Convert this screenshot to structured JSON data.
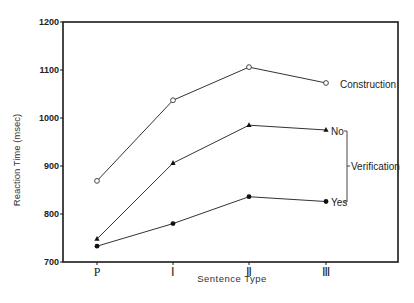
{
  "chart_data": {
    "type": "line",
    "title": "",
    "xlabel": "Sentence Type",
    "ylabel": "Reaction Time (msec)",
    "categories": [
      "P",
      "I",
      "II",
      "III"
    ],
    "category_glyphs": [
      "P",
      "Ⅰ",
      "Ⅱ",
      "Ⅲ"
    ],
    "ylim": [
      700,
      1200
    ],
    "yticks": [
      700,
      800,
      900,
      1000,
      1100,
      1200
    ],
    "grid": false,
    "series": [
      {
        "name": "Construction",
        "marker": "open-circle",
        "values": [
          869,
          1037,
          1106,
          1073
        ]
      },
      {
        "name": "No",
        "marker": "filled-triangle",
        "values": [
          748,
          906,
          985,
          975
        ]
      },
      {
        "name": "Yes",
        "marker": "filled-circle",
        "values": [
          733,
          780,
          836,
          826
        ]
      }
    ],
    "annotations": [
      {
        "text": "Construction",
        "target": "Construction"
      },
      {
        "text": "No",
        "target": "No"
      },
      {
        "text": "Yes",
        "target": "Yes"
      },
      {
        "text": "Verification",
        "bracket": [
          "No",
          "Yes"
        ]
      }
    ],
    "legend_position": "inline-right"
  },
  "labels": {
    "ylabel": "Reaction Time (msec)",
    "xlabel": "Sentence Type",
    "construction": "Construction",
    "no": "No",
    "yes": "Yes",
    "verification": "Verification"
  }
}
